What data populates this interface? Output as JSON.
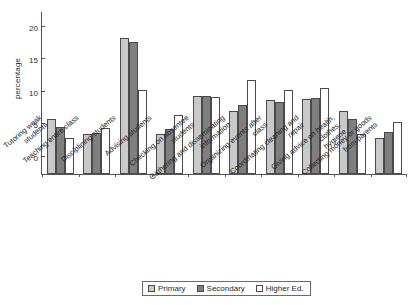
{
  "chart_data": {
    "type": "bar",
    "title": "",
    "xlabel": "",
    "ylabel": "percentage",
    "ylim": [
      0,
      25
    ],
    "yticks": [
      0,
      5,
      10,
      15,
      20,
      25
    ],
    "grid": false,
    "legend_position": "bottom",
    "categories": [
      "Tutoring weak\nstudents",
      "Teaching entire class",
      "Disciplining students",
      "Advising students",
      "Checking on absentee students",
      "Gathering and disseminating\ninformation",
      "Organizing events after\nclass",
      "Coordinating cleaning and\nrepair",
      "Giving advice on health, clothes,\nhygiene",
      "Collecting money or goods\nfrom parents"
    ],
    "series": [
      {
        "name": "Primary",
        "color": "#c9c9c9",
        "values": [
          8.5,
          6.1,
          20.8,
          6.2,
          11.9,
          9.7,
          11.3,
          11.5,
          9.6,
          5.6
        ]
      },
      {
        "name": "Secondary",
        "color": "#7f7f7f",
        "values": [
          7.2,
          6.3,
          20.3,
          6.9,
          12.0,
          10.6,
          11.1,
          11.7,
          8.5,
          6.5
        ]
      },
      {
        "name": "Higher Ed.",
        "color": "#ffffff",
        "values": [
          5.6,
          7.1,
          12.9,
          9.0,
          11.8,
          14.4,
          12.9,
          13.2,
          6.2,
          8.0
        ]
      }
    ]
  }
}
